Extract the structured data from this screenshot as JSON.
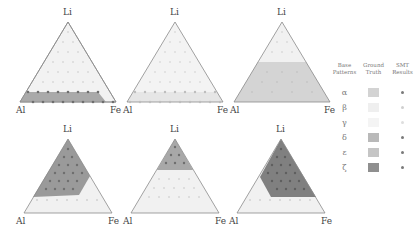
{
  "colors": {
    "outline": "#8a8a8a",
    "base_fill": "#f1f1f1",
    "alpha": "#d3d3d3",
    "beta": "#eeeeee",
    "gamma": "#f3f3f3",
    "delta": "#b8b8b8",
    "epsilon": "#c4c4c4",
    "zeta": "#8f8f8f",
    "dot_dark": "#6e6e6e",
    "dot_light": "#d9d9d9"
  },
  "vertex_labels": {
    "top": "Li",
    "left": "Al",
    "right": "Fe"
  },
  "panels": [
    {
      "id": "alpha",
      "region": "bottom band (Li low)",
      "fill": "#a9a9a9"
    },
    {
      "id": "beta",
      "region": "bottom band (Li low), light",
      "fill": "#e6e6e6"
    },
    {
      "id": "gamma",
      "region": "lower 2/3 of triangle",
      "fill": "#d4d4d4"
    },
    {
      "id": "delta",
      "region": "Li-rich / Al-side region",
      "fill": "#9a9a9a"
    },
    {
      "id": "epsilon",
      "region": "Li-rich top cap",
      "fill": "#a8a8a8"
    },
    {
      "id": "zeta",
      "region": "Li-rich / Fe-side region",
      "fill": "#808080"
    }
  ],
  "legend": {
    "headers": [
      "Base Patterns",
      "Ground Truth",
      "SMT Results"
    ],
    "rows": [
      {
        "symbol": "α",
        "swatch": "#d3d3d3",
        "dot": "#7a7a7a"
      },
      {
        "symbol": "β",
        "swatch": "#efefef",
        "dot": "#cfcfcf"
      },
      {
        "symbol": "γ",
        "swatch": "#f4f4f4",
        "dot": "#dedede"
      },
      {
        "symbol": "δ",
        "swatch": "#b9b9b9",
        "dot": "#7a7a7a"
      },
      {
        "symbol": "ε",
        "swatch": "#c5c5c5",
        "dot": "#7a7a7a"
      },
      {
        "symbol": "ζ",
        "swatch": "#8f8f8f",
        "dot": "#7a7a7a"
      }
    ]
  }
}
